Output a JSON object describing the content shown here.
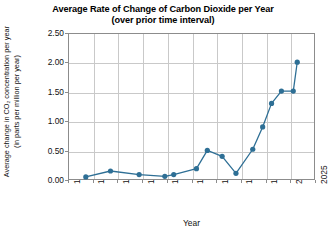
{
  "chart_data": {
    "type": "line",
    "title": "Average Rate of Change of Carbon Dioxide per Year",
    "subtitle": "(over prior time interval)",
    "xlabel": "Year",
    "ylabel": "Average change in CO₂ concentration per year (in parts per million per year)",
    "xlim": [
      1775,
      2025
    ],
    "ylim": [
      0.0,
      2.5
    ],
    "xticks": [
      1775,
      1800,
      1825,
      1850,
      1875,
      1900,
      1925,
      1950,
      1975,
      2000,
      2025
    ],
    "yticks": [
      "0.00",
      "0.50",
      "1.00",
      "1.50",
      "2.00",
      "2.50"
    ],
    "ytick_values": [
      0.0,
      0.5,
      1.0,
      1.5,
      2.0,
      2.5
    ],
    "grid": true,
    "legend": "none",
    "marker": "circle",
    "series_color": "#2e6f95",
    "x": [
      1792,
      1817,
      1846,
      1872,
      1881,
      1904,
      1915,
      1930,
      1944,
      1961,
      1971,
      1980,
      1990,
      2002,
      2006
    ],
    "values": [
      0.07,
      0.17,
      0.11,
      0.08,
      0.11,
      0.21,
      0.52,
      0.42,
      0.13,
      0.54,
      0.92,
      1.32,
      1.53,
      1.53,
      2.02
    ],
    "points": [
      {
        "x": 1792,
        "y": 0.07
      },
      {
        "x": 1817,
        "y": 0.17
      },
      {
        "x": 1846,
        "y": 0.11
      },
      {
        "x": 1872,
        "y": 0.08
      },
      {
        "x": 1881,
        "y": 0.11
      },
      {
        "x": 1904,
        "y": 0.21
      },
      {
        "x": 1915,
        "y": 0.52
      },
      {
        "x": 1930,
        "y": 0.42
      },
      {
        "x": 1944,
        "y": 0.13
      },
      {
        "x": 1961,
        "y": 0.54
      },
      {
        "x": 1971,
        "y": 0.92
      },
      {
        "x": 1980,
        "y": 1.32
      },
      {
        "x": 1990,
        "y": 1.53
      },
      {
        "x": 2002,
        "y": 1.53
      },
      {
        "x": 2006,
        "y": 2.02
      }
    ]
  },
  "colors": {
    "series": "#2e6f95",
    "grid": "#c9c9c9",
    "axis": "#8c8c8c",
    "text": "#111111",
    "background": "#ffffff"
  }
}
